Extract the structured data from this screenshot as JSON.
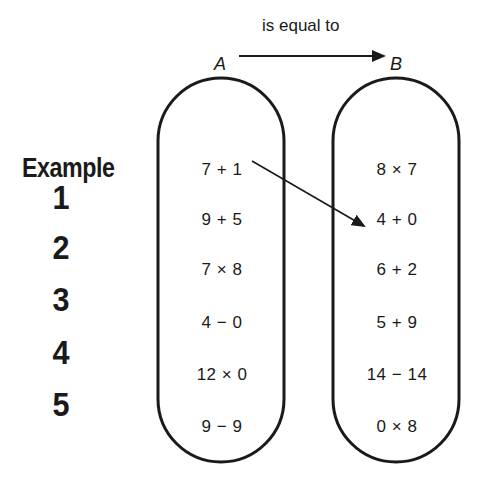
{
  "relation": {
    "label": "is equal to",
    "from": "A",
    "to": "B"
  },
  "sets": {
    "A": {
      "label": "A",
      "items": [
        "7 + 1",
        "9 + 5",
        "7 × 8",
        "4 − 0",
        "12 × 0",
        "9 − 9"
      ]
    },
    "B": {
      "label": "B",
      "items": [
        "8 × 7",
        "4 + 0",
        "6 + 2",
        "5 + 9",
        "14 − 14",
        "0 × 8"
      ]
    }
  },
  "rows": {
    "labels": [
      "Example",
      "1",
      "2",
      "3",
      "4",
      "5"
    ]
  },
  "example_mapping": {
    "from": "7 + 1",
    "to": "6 + 2"
  },
  "colors": {
    "stroke": "#1a1a1a",
    "background": "#ffffff"
  }
}
